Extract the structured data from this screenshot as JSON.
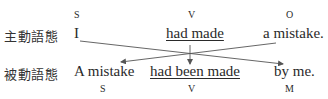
{
  "rows": [
    {
      "label": "主動語態",
      "words": [
        {
          "text": "I",
          "role": "S",
          "underline": false
        },
        {
          "text": "had made",
          "role": "V",
          "underline": true
        },
        {
          "text": "a mistake.",
          "role": "O",
          "underline": false
        }
      ]
    },
    {
      "label": "被動語態",
      "words": [
        {
          "text": "A mistake",
          "role": "S",
          "underline": false
        },
        {
          "text": "had been made",
          "role": "V",
          "underline": true
        },
        {
          "text": "by me.",
          "role": "M",
          "underline": false
        }
      ]
    }
  ],
  "arrows": [
    {
      "from": "I",
      "to": "by me."
    },
    {
      "from": "a mistake.",
      "to": "A mistake"
    },
    {
      "from": "had made",
      "to": "had been made"
    }
  ],
  "colors": {
    "text": "#2a2a2a",
    "arrow": "#555555"
  }
}
